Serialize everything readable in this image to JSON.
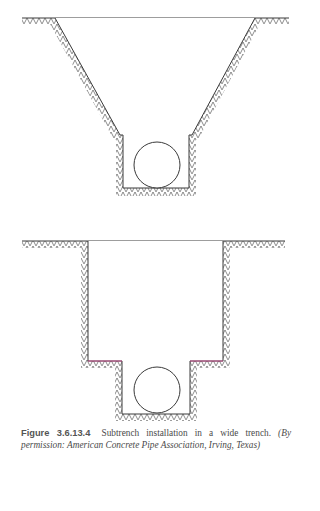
{
  "figure": {
    "label": "Figure 3.6.13.4",
    "title": "Subtrench installation in a wide trench.",
    "credit": "(By permission: American Concrete Pipe Association, Irving, Texas)"
  },
  "diagrams": [
    {
      "name": "sloped-wide-trench-with-subtrench",
      "ground_y": 18,
      "ground_x": [
        22,
        289
      ],
      "trench_top_x": [
        55,
        255
      ],
      "trench_ledge_y": 135,
      "subtrench_x": [
        123,
        189
      ],
      "subtrench_bottom_y": 188,
      "pipe": {
        "cx": 157,
        "cy": 165,
        "r": 23
      }
    },
    {
      "name": "vertical-wide-trench-with-subtrench",
      "ground_y": 241,
      "ground_x": [
        22,
        285
      ],
      "trench_x": [
        88,
        223
      ],
      "trench_ledge_y": 361,
      "subtrench_x": [
        122,
        190
      ],
      "subtrench_bottom_y": 414,
      "pipe": {
        "cx": 157,
        "cy": 390,
        "r": 23
      }
    }
  ],
  "colors": {
    "line": "#3a3a3a",
    "hatch": "#5a5a5a",
    "ledge_accent": "#d23c8c",
    "caption": "#4a4a4a"
  }
}
